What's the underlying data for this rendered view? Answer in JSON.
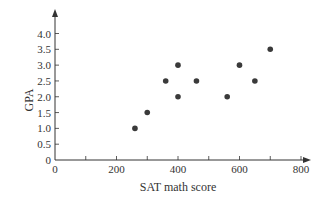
{
  "chart_data": {
    "type": "scatter",
    "title": "",
    "xlabel": "SAT math score",
    "ylabel": "GPA",
    "xlim": [
      0,
      800
    ],
    "ylim": [
      0,
      4.0
    ],
    "x_ticks": [
      0,
      200,
      400,
      600,
      800
    ],
    "x_tick_labels": [
      "0",
      "200",
      "400",
      "600",
      "800"
    ],
    "x_minor_ticks": [
      100,
      200,
      300,
      400,
      500,
      600,
      700,
      800
    ],
    "y_ticks": [
      0,
      0.5,
      1.0,
      1.5,
      2.0,
      2.5,
      3.0,
      3.5,
      4.0
    ],
    "y_tick_labels": [
      "0",
      "0.5",
      "1.0",
      "1.5",
      "2.0",
      "2.5",
      "3.0",
      "3.5",
      "4.0"
    ],
    "grid": false,
    "legend": null,
    "series": [
      {
        "name": "Students",
        "points": [
          {
            "x": 260,
            "y": 1.0
          },
          {
            "x": 300,
            "y": 1.5
          },
          {
            "x": 360,
            "y": 2.5
          },
          {
            "x": 400,
            "y": 3.0
          },
          {
            "x": 400,
            "y": 2.0
          },
          {
            "x": 460,
            "y": 2.5
          },
          {
            "x": 560,
            "y": 2.0
          },
          {
            "x": 600,
            "y": 3.0
          },
          {
            "x": 650,
            "y": 2.5
          },
          {
            "x": 700,
            "y": 3.5
          }
        ]
      }
    ],
    "colors": {
      "axis": "#333333",
      "marker": "#3a3a3a",
      "text": "#333333"
    }
  }
}
